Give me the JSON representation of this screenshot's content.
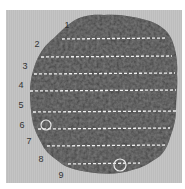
{
  "figure": {
    "background_color": "#c0c0c0",
    "specimen_color": "#3a3a3a",
    "line_color": "#ffffff",
    "labels": [
      {
        "text": "1",
        "x": 67,
        "y": 25
      },
      {
        "text": "2",
        "x": 37,
        "y": 44
      },
      {
        "text": "3",
        "x": 25,
        "y": 66
      },
      {
        "text": "4",
        "x": 21,
        "y": 85
      },
      {
        "text": "5",
        "x": 21,
        "y": 105
      },
      {
        "text": "6",
        "x": 22,
        "y": 125
      },
      {
        "text": "7",
        "x": 29,
        "y": 141
      },
      {
        "text": "8",
        "x": 41,
        "y": 159
      },
      {
        "text": "9",
        "x": 61,
        "y": 175
      }
    ],
    "transects": [
      {
        "y": 39,
        "x1": 62,
        "x2": 167
      },
      {
        "y": 57,
        "x1": 41,
        "x2": 172
      },
      {
        "y": 74,
        "x1": 34,
        "x2": 175
      },
      {
        "y": 91,
        "x1": 30,
        "x2": 176
      },
      {
        "y": 112,
        "x1": 33,
        "x2": 176
      },
      {
        "y": 129,
        "x1": 38,
        "x2": 170
      },
      {
        "y": 146,
        "x1": 47,
        "x2": 166
      },
      {
        "y": 164,
        "x1": 68,
        "x2": 140
      }
    ],
    "markers": [
      {
        "shape": "circle",
        "cx": 46,
        "cy": 125,
        "r": 5
      },
      {
        "shape": "circle",
        "cx": 120,
        "cy": 165,
        "r": 6
      }
    ]
  }
}
